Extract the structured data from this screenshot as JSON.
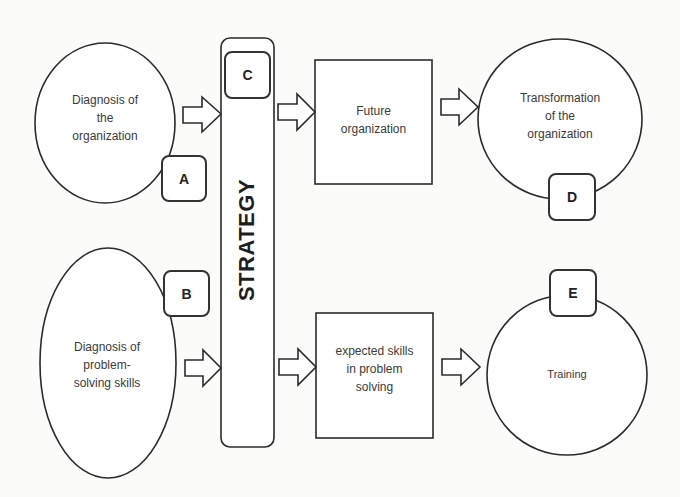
{
  "diagram": {
    "type": "flow",
    "nodes": {
      "diag_org": {
        "label": "Diagnosis of the organization",
        "lines": [
          "Diagnosis of",
          "the",
          "organization"
        ],
        "shape": "ellipse",
        "tag": "A"
      },
      "diag_skills": {
        "label": "Diagnosis of problem-solving skills",
        "lines": [
          "Diagnosis of",
          "problem-",
          "solving skills"
        ],
        "shape": "ellipse",
        "tag": "B"
      },
      "strategy": {
        "label": "STRATEGY",
        "shape": "rounded-bar",
        "tag": "C"
      },
      "future_org": {
        "label": "Future organization",
        "lines": [
          "Future",
          "organization"
        ],
        "shape": "rectangle"
      },
      "expected_skills": {
        "label": "expected skills in problem solving",
        "lines": [
          "expected skills",
          "in problem",
          "solving"
        ],
        "shape": "rectangle"
      },
      "transformation": {
        "label": "Transformation of the organization",
        "lines": [
          "Transformation",
          "of the",
          "organization"
        ],
        "shape": "circle",
        "tag": "D"
      },
      "training": {
        "label": "Training",
        "lines": [
          "Training"
        ],
        "shape": "circle",
        "tag": "E"
      }
    },
    "tags": {
      "a": "A",
      "b": "B",
      "c": "C",
      "d": "D",
      "e": "E"
    },
    "edges": [
      {
        "from": "diag_org",
        "to": "strategy"
      },
      {
        "from": "diag_skills",
        "to": "strategy"
      },
      {
        "from": "strategy",
        "to": "future_org"
      },
      {
        "from": "strategy",
        "to": "expected_skills"
      },
      {
        "from": "future_org",
        "to": "transformation"
      },
      {
        "from": "expected_skills",
        "to": "training"
      }
    ],
    "colors": {
      "stroke": "#2b2b2b",
      "fill": "#ffffff",
      "text": "#3a3a3a",
      "background": "#fbfbfa"
    }
  }
}
